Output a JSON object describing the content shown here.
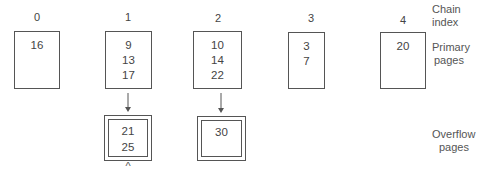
{
  "labels": {
    "chain_index": [
      "Chain",
      "index"
    ],
    "primary_pages": [
      "Primary",
      "pages"
    ],
    "overflow_pages": [
      "Overflow",
      "pages"
    ]
  },
  "chains": [
    {
      "index": "0",
      "primary": [
        "16"
      ],
      "overflow": null
    },
    {
      "index": "1",
      "primary": [
        "9",
        "13",
        "17"
      ],
      "overflow": [
        "21",
        "25"
      ]
    },
    {
      "index": "2",
      "primary": [
        "10",
        "14",
        "22"
      ],
      "overflow": [
        "30"
      ]
    },
    {
      "index": "3",
      "primary": [
        "3",
        "7"
      ],
      "overflow": null
    },
    {
      "index": "4",
      "primary": [
        "20"
      ],
      "overflow": null
    }
  ],
  "marker_symbol": "^"
}
